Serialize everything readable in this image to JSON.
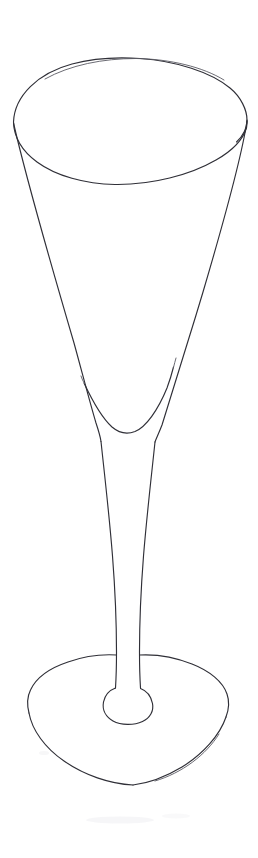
{
  "canvas": {
    "width": 258,
    "height": 858,
    "background_color": "#ffffff",
    "title": "Champagne Flute Line Drawing",
    "medium": "pencil line drawing",
    "subject": "champagne flute glass"
  },
  "palette": {
    "paper": "#ffffff",
    "ink": "#2f2f37",
    "ink_soft": "#5a5a63",
    "ink_faint": "#b9b9c0",
    "smudge": "#efeff2"
  },
  "drawing": {
    "name": "champagne-flute",
    "description": "A tall stemmed champagne flute drawn in a single thin pencil contour line on plain white paper. The wide elliptical rim is seen from slightly above, the conical bowl tapers sharply down to a long slender stem, and the stem flares into a small knop before spreading into a wide elliptical foot.",
    "parts": [
      {
        "id": "rim",
        "label": "Rim ellipse",
        "cx": 130,
        "cy": 121,
        "rx": 117,
        "ry": 62,
        "top_y": 59,
        "bottom_y": 183,
        "left_x": 13,
        "right_x": 247
      },
      {
        "id": "bowl-left-wall",
        "label": "Bowl left wall",
        "start": [
          13,
          124
        ],
        "end": [
          101,
          441
        ]
      },
      {
        "id": "bowl-right-wall",
        "label": "Bowl right wall",
        "start": [
          247,
          139
        ],
        "end": [
          155,
          441
        ]
      },
      {
        "id": "bowl-inner-curve",
        "label": "Inner bowl floor curve",
        "left_branch": [
          84,
          383
        ],
        "bottom": [
          128,
          433
        ],
        "right_branch": [
          173,
          367
        ]
      },
      {
        "id": "stem",
        "label": "Stem",
        "top_left": [
          101,
          441
        ],
        "top_right": [
          155,
          441
        ],
        "bottom_left": [
          116,
          652
        ],
        "bottom_right": [
          139,
          652
        ],
        "length": 211
      },
      {
        "id": "knop",
        "label": "Stem knop at foot",
        "cx": 128,
        "cy": 706,
        "rx": 25,
        "ry": 19,
        "top_y": 686,
        "bottom_y": 724
      },
      {
        "id": "foot",
        "label": "Foot ellipse",
        "cx": 128,
        "cy": 722,
        "rx": 100,
        "ry": 70,
        "top_y": 652,
        "bottom_y": 792,
        "left_x": 28,
        "right_x": 228
      }
    ]
  },
  "accessibility": {
    "alt_text": "Pencil line drawing of a tall champagne flute with a wide elliptical rim, a long slender stem and a broad round foot."
  }
}
